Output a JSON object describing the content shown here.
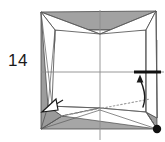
{
  "figure": {
    "step_number": "14",
    "type": "origami-folding-step",
    "title_visible": false
  },
  "colors": {
    "paper_front": "#ffffff",
    "paper_shaded": "#9c9c9c",
    "paper_shaded_dark": "#8a8a8a",
    "paper_shaded_light": "#b5b5b5",
    "outline": "#3c3c3c",
    "crease_line": "#8d8d8d",
    "dotted_line": "#9a9a9a",
    "arrow": "#1a1a1a",
    "marker_bar": "#111111",
    "corner_dot": "#111111",
    "number_text": "#1a1a1a",
    "background": "#ffffff"
  },
  "geometry": {
    "corners": {
      "top_left": [
        41,
        12
      ],
      "top_right": [
        156,
        11
      ],
      "bottom_left": [
        41,
        129
      ],
      "bottom_right": [
        157,
        129
      ]
    },
    "center_crease_horizontal_y": 72,
    "center_crease_vertical_x": 100
  },
  "annotations": {
    "corner_dot": {
      "name": "reference-dot",
      "position": [
        157,
        129
      ],
      "radius": 4.2
    },
    "marker_bar": {
      "name": "edge-emphasis-bar",
      "from": [
        135,
        72
      ],
      "to": [
        160,
        72
      ],
      "thickness": 3
    },
    "arrow_up": {
      "name": "fold-arrow-up",
      "description": "curved arrow pointing up toward emphasized edge",
      "tip": [
        140,
        76
      ],
      "tail": [
        143,
        107
      ]
    },
    "arrow_open": {
      "name": "unfold-arrow-open",
      "description": "hollow arrowhead pointing down-left",
      "tip": [
        42,
        112
      ],
      "tail": [
        62,
        101
      ]
    },
    "dotted_line": {
      "name": "hidden-edge-dotted",
      "from": [
        61,
        116
      ],
      "to": [
        150,
        99
      ]
    }
  }
}
